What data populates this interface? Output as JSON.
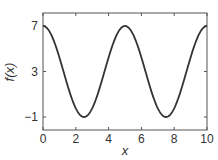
{
  "chart_data": {
    "type": "line",
    "title": "",
    "xlabel": "x",
    "ylabel": "f(x)",
    "xlim": [
      0,
      10
    ],
    "ylim": [
      -2,
      8.5
    ],
    "xticks": [
      0,
      2,
      4,
      6,
      8,
      10
    ],
    "xtick_labels": [
      "0",
      "2",
      "4",
      "6",
      "8",
      "10"
    ],
    "yticks": [
      -1,
      3,
      7
    ],
    "ytick_labels": [
      "−1",
      "3",
      "7"
    ],
    "grid": false,
    "legend": null,
    "series": [
      {
        "name": "f(x)",
        "color": "#333333",
        "description": "sinusoid f(x) = 3 + 4 sin(2π(x + 1.25)/5)",
        "x": [
          0,
          0.5,
          1,
          1.5,
          2,
          2.5,
          3,
          3.5,
          4,
          4.5,
          5,
          5.5,
          6,
          6.5,
          7,
          7.5,
          8,
          8.5,
          9,
          9.5,
          10
        ],
        "y": [
          4.24,
          6.24,
          7.0,
          6.24,
          4.24,
          1.76,
          -0.24,
          -1.0,
          -0.24,
          1.76,
          4.24,
          6.24,
          7.0,
          6.24,
          4.24,
          1.76,
          -0.24,
          -1.0,
          -0.24,
          1.76,
          4.24
        ]
      }
    ]
  }
}
